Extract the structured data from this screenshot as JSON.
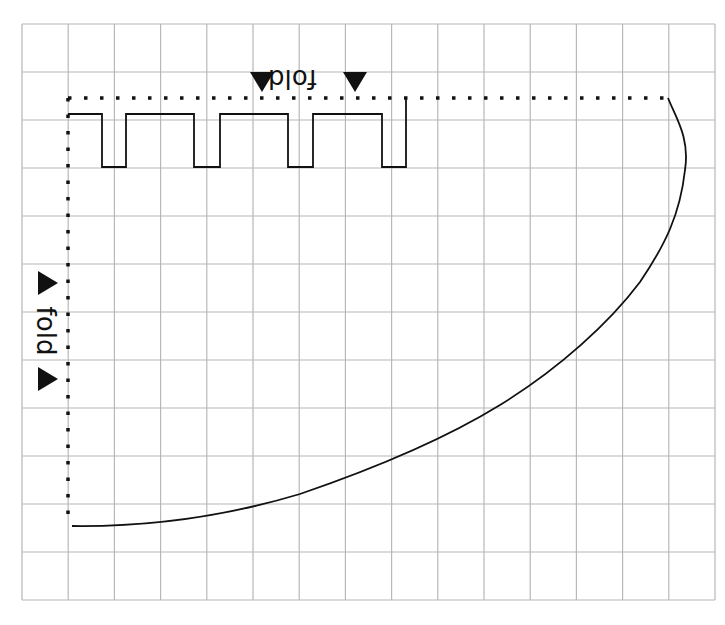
{
  "diagram": {
    "type": "sewing-pattern-on-grid",
    "grid": {
      "columns": 15,
      "rows": 12,
      "left": 22,
      "top": 24,
      "right": 715,
      "bottom": 600,
      "line_color": "#b8b8b8"
    },
    "labels": {
      "top_fold": "fold",
      "left_fold": "fold"
    },
    "colors": {
      "outline": "#111111",
      "fold_line": "#111111",
      "background": "#ffffff"
    },
    "fold_lines": [
      {
        "name": "top-fold-line",
        "from": [
          68,
          98
        ],
        "to": [
          668,
          98
        ]
      },
      {
        "name": "left-fold-line",
        "from": [
          68,
          98
        ],
        "to": [
          68,
          520
        ]
      }
    ],
    "arrows": [
      {
        "name": "top-fold-arrow-left",
        "x": 262,
        "y": 82,
        "direction": "down"
      },
      {
        "name": "top-fold-arrow-right",
        "x": 355,
        "y": 82,
        "direction": "down"
      },
      {
        "name": "left-fold-arrow-top",
        "x": 48,
        "y": 283,
        "direction": "right"
      },
      {
        "name": "left-fold-arrow-bottom",
        "x": 48,
        "y": 379,
        "direction": "right"
      }
    ]
  }
}
